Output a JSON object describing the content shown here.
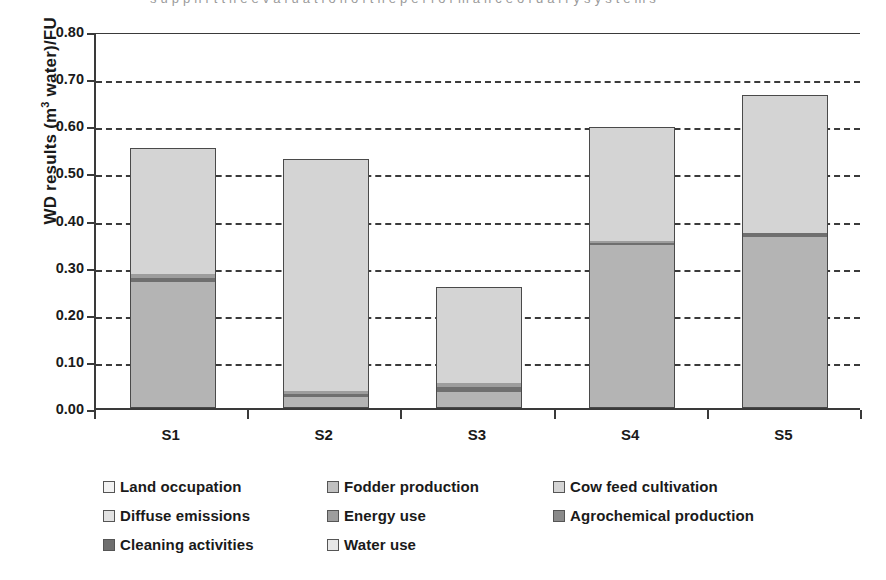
{
  "top_cropped_text": "s u p p n r t t h e e v a l u a t i o n  o f  t h e  p e r f o r m a n c e  o f  d a i r y  s y s t e m s",
  "axes": {
    "y_title": "WD results (m",
    "y_title_sup": "3",
    "y_title_tail": " water)/FU",
    "y_ticks": [
      "0.80",
      "0.70",
      "0.60",
      "0.50",
      "0.40",
      "0.30",
      "0.20",
      "0.10",
      "0.00"
    ],
    "x_labels": [
      "S1",
      "S2",
      "S3",
      "S4",
      "S5"
    ]
  },
  "legend": {
    "rows": [
      [
        {
          "label": "Land occupation",
          "color": "#f2f2f2"
        },
        {
          "label": "Fodder production",
          "color": "#c0c0c0"
        },
        {
          "label": "Cow feed cultivation",
          "color": "#d4d4d4"
        }
      ],
      [
        {
          "label": "Diffuse emissions",
          "color": "#e2e2e2"
        },
        {
          "label": "Energy use",
          "color": "#9d9d9d"
        },
        {
          "label": "Agrochemical production",
          "color": "#8a8a8a"
        }
      ],
      [
        {
          "label": "Cleaning activities",
          "color": "#6f6f6f"
        },
        {
          "label": "Water use",
          "color": "#e8e8e8"
        }
      ]
    ]
  },
  "chart_data": {
    "type": "bar",
    "subtype": "stacked",
    "title": "",
    "xlabel": "",
    "ylabel": "WD results (m3 water)/FU",
    "ylim": [
      0.0,
      0.8
    ],
    "ytick_step": 0.1,
    "grid": "horizontal-dashed",
    "legend_position": "bottom",
    "categories": [
      "S1",
      "S2",
      "S3",
      "S4",
      "S5"
    ],
    "series": [
      {
        "name": "Land occupation",
        "color": "#f2f2f2",
        "values": [
          0.0,
          0.0,
          0.0,
          0.0,
          0.0
        ]
      },
      {
        "name": "Fodder production",
        "color": "#c0c0c0",
        "values": [
          0.0,
          0.0,
          0.0,
          0.0,
          0.0
        ]
      },
      {
        "name": "Cow feed cultivation",
        "color": "#d4d4d4",
        "values": [
          0.266,
          0.491,
          0.204,
          0.242,
          0.293
        ]
      },
      {
        "name": "Diffuse emissions",
        "color": "#e2e2e2",
        "values": [
          0.0,
          0.0,
          0.0,
          0.0,
          0.0
        ]
      },
      {
        "name": "Energy use",
        "color": "#9d9d9d",
        "values": [
          0.009,
          0.007,
          0.009,
          0.005,
          0.0
        ]
      },
      {
        "name": "Agrochemical production",
        "color": "#8a8a8a",
        "values": [
          0.0,
          0.0,
          0.0,
          0.0,
          0.0
        ]
      },
      {
        "name": "Cleaning activities",
        "color": "#6f6f6f",
        "values": [
          0.009,
          0.006,
          0.009,
          0.005,
          0.009
        ]
      },
      {
        "name": "Water use",
        "color": "#b4b4b4",
        "values": [
          0.267,
          0.024,
          0.035,
          0.345,
          0.363
        ]
      }
    ],
    "totals": [
      0.551,
      0.528,
      0.257,
      0.597,
      0.665
    ],
    "stack_order_bottom_to_top": [
      "Water use",
      "Cleaning activities",
      "Energy use",
      "Cow feed cultivation"
    ]
  },
  "render": {
    "bars": [
      {
        "category": "S1",
        "total": 0.551,
        "segments": [
          {
            "name": "Water use",
            "from": 0.0,
            "to": 0.267,
            "color": "#b4b4b4"
          },
          {
            "name": "Cleaning activities",
            "from": 0.267,
            "to": 0.276,
            "color": "#6f6f6f"
          },
          {
            "name": "Energy use",
            "from": 0.276,
            "to": 0.285,
            "color": "#9d9d9d"
          },
          {
            "name": "Cow feed cultivation",
            "from": 0.285,
            "to": 0.551,
            "color": "#d4d4d4"
          }
        ]
      },
      {
        "category": "S2",
        "total": 0.528,
        "segments": [
          {
            "name": "Water use",
            "from": 0.0,
            "to": 0.024,
            "color": "#b4b4b4"
          },
          {
            "name": "Cleaning activities",
            "from": 0.024,
            "to": 0.03,
            "color": "#6f6f6f"
          },
          {
            "name": "Energy use",
            "from": 0.03,
            "to": 0.037,
            "color": "#9d9d9d"
          },
          {
            "name": "Cow feed cultivation",
            "from": 0.037,
            "to": 0.528,
            "color": "#d4d4d4"
          }
        ]
      },
      {
        "category": "S3",
        "total": 0.257,
        "segments": [
          {
            "name": "Water use",
            "from": 0.0,
            "to": 0.035,
            "color": "#b4b4b4"
          },
          {
            "name": "Cleaning activities",
            "from": 0.035,
            "to": 0.044,
            "color": "#6f6f6f"
          },
          {
            "name": "Energy use",
            "from": 0.044,
            "to": 0.053,
            "color": "#9d9d9d"
          },
          {
            "name": "Cow feed cultivation",
            "from": 0.053,
            "to": 0.257,
            "color": "#d4d4d4"
          }
        ]
      },
      {
        "category": "S4",
        "total": 0.597,
        "segments": [
          {
            "name": "Water use",
            "from": 0.0,
            "to": 0.345,
            "color": "#b4b4b4"
          },
          {
            "name": "Cleaning activities",
            "from": 0.345,
            "to": 0.35,
            "color": "#6f6f6f"
          },
          {
            "name": "Energy use",
            "from": 0.35,
            "to": 0.355,
            "color": "#9d9d9d"
          },
          {
            "name": "Cow feed cultivation",
            "from": 0.355,
            "to": 0.597,
            "color": "#d4d4d4"
          }
        ]
      },
      {
        "category": "S5",
        "total": 0.665,
        "segments": [
          {
            "name": "Water use",
            "from": 0.0,
            "to": 0.363,
            "color": "#b4b4b4"
          },
          {
            "name": "Cleaning activities",
            "from": 0.363,
            "to": 0.372,
            "color": "#6f6f6f"
          },
          {
            "name": "Cow feed cultivation",
            "from": 0.372,
            "to": 0.665,
            "color": "#d4d4d4"
          }
        ]
      }
    ]
  }
}
